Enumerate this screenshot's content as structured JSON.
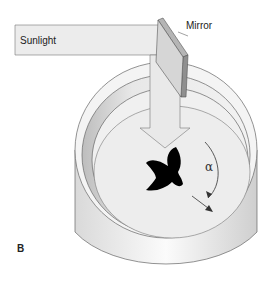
{
  "figure": {
    "panel_label": "B",
    "labels": {
      "sunlight": "Sunlight",
      "mirror": "Mirror",
      "angle": "α"
    },
    "elements": [
      "sunlight-beam",
      "mirror",
      "circular-cage",
      "bird-silhouette",
      "angle-arrow"
    ],
    "colors": {
      "beam": "#ececec",
      "outline": "#555555",
      "cage_wall": "#e6e6e6",
      "cage_floor": "#efefef",
      "bird": "#000000"
    }
  }
}
